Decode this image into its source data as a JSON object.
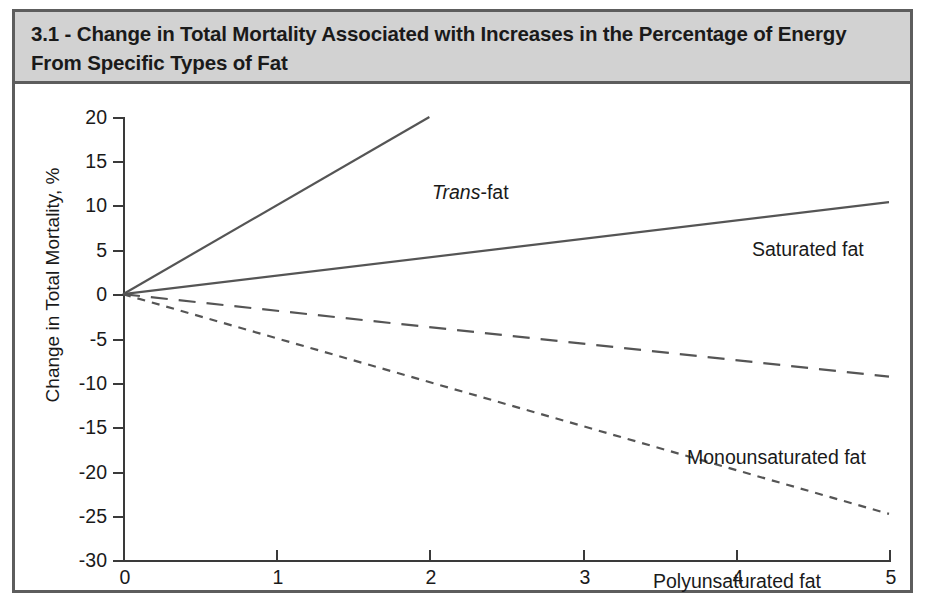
{
  "figure": {
    "title": "3.1 - Change in Total Mortality Associated with Increases in the Percentage of Energy From Specific Types of Fat",
    "border_color": "#5d5d5d",
    "title_bar_color": "#d2d2d2"
  },
  "labels": {
    "trans_italic": "Trans",
    "trans_rest": "-fat",
    "saturated": "Saturated fat",
    "monounsaturated": "Monounsaturated fat",
    "polyunsaturated": "Polyunsaturated fat"
  },
  "chart_data": {
    "type": "line",
    "title": "3.1 - Change in Total Mortality Associated with Increases in the Percentage of Energy From Specific Types of Fat",
    "xlabel": "",
    "ylabel": "Change in Total Mortality, %",
    "xlim": [
      0,
      5
    ],
    "ylim": [
      -30,
      20
    ],
    "xticks": [
      0,
      1,
      2,
      3,
      4,
      5
    ],
    "yticks": [
      20,
      15,
      10,
      5,
      0,
      -5,
      -10,
      -15,
      -20,
      -25,
      -30
    ],
    "xtick_labels": [
      "0",
      "1",
      "2",
      "3",
      "4",
      "5"
    ],
    "ytick_labels": [
      "20",
      "15",
      "10",
      "5",
      "0",
      "-5",
      "-10",
      "-15",
      "-20",
      "-25",
      "-30"
    ],
    "grid": false,
    "legend": "inline-labels",
    "line_color": "#555555",
    "series": [
      {
        "name": "Trans-fat",
        "style": "solid",
        "x": [
          0,
          2
        ],
        "y": [
          0,
          20
        ],
        "slope_per_percent_energy": 10.0
      },
      {
        "name": "Saturated fat",
        "style": "solid",
        "x": [
          0,
          5
        ],
        "y": [
          0,
          10.4
        ],
        "slope_per_percent_energy": 2.08
      },
      {
        "name": "Monounsaturated fat",
        "style": "long-dashed",
        "x": [
          0,
          5
        ],
        "y": [
          0,
          -9.3
        ],
        "slope_per_percent_energy": -1.86
      },
      {
        "name": "Polyunsaturated fat",
        "style": "short-dashed",
        "x": [
          0,
          5
        ],
        "y": [
          0,
          -24.8
        ],
        "slope_per_percent_energy": -4.96
      }
    ]
  }
}
